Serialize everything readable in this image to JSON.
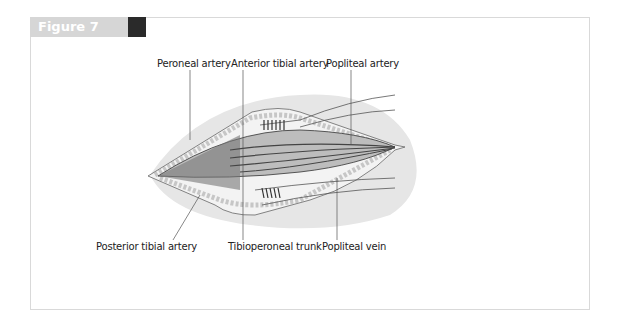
{
  "figure": {
    "title": "Figure 7",
    "labels_top": [
      "Peroneal artery",
      "Anterior tibial artery",
      "Popliteal artery"
    ],
    "labels_bottom": [
      "Posterior tibial artery",
      "Tibioperoneal trunk",
      "Popliteal vein"
    ]
  }
}
